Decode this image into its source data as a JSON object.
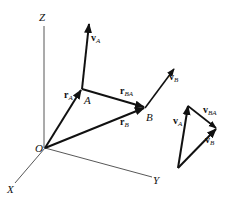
{
  "diagram": {
    "axes": {
      "z_label": "Z",
      "x_label": "X",
      "y_label": "Y",
      "origin_label": "O"
    },
    "points": {
      "a_label": "A",
      "b_label": "B"
    },
    "vectors": {
      "r_a": {
        "main": "r",
        "sub": "A"
      },
      "r_b": {
        "main": "r",
        "sub": "B"
      },
      "r_ba": {
        "main": "r",
        "sub": "BA"
      },
      "v_a": {
        "main": "v",
        "sub": "A"
      },
      "v_b": {
        "main": "v",
        "sub": "B"
      }
    },
    "triangle": {
      "v_a": {
        "main": "v",
        "sub": "A"
      },
      "v_ba": {
        "main": "v",
        "sub": "BA"
      },
      "v_b": {
        "main": "v",
        "sub": "B"
      }
    },
    "colors": {
      "ink": "#111111",
      "axis": "#444444",
      "background": "#ffffff"
    }
  }
}
